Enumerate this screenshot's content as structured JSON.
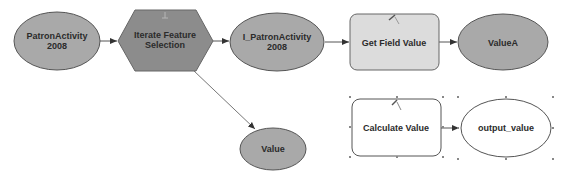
{
  "diagram": {
    "type": "model-builder-flowchart",
    "colors": {
      "background": "#ffffff",
      "data_fill": "#a9a9a9",
      "tool_fill_dark": "#8c8c8c",
      "tool_fill_light": "#dcdcdc",
      "output_fill": "#ffffff",
      "stroke": "#555555",
      "connector": "#555555",
      "handle": "#888888"
    },
    "nodes": [
      {
        "id": "patron_activity_2008",
        "shape": "ellipse",
        "label_line1": "PatronActivity",
        "label_line2": "2008"
      },
      {
        "id": "iterate_feature_selection",
        "shape": "hexagon",
        "label_line1": "Iterate Feature",
        "label_line2": "Selection"
      },
      {
        "id": "i_patron_activity_2008",
        "shape": "ellipse",
        "label_line1": "I_PatronActivity",
        "label_line2": "2008"
      },
      {
        "id": "get_field_value",
        "shape": "rounded-rect",
        "label_line1": "Get Field Value"
      },
      {
        "id": "value_a",
        "shape": "ellipse",
        "label_line1": "ValueA"
      },
      {
        "id": "value",
        "shape": "ellipse",
        "label_line1": "Value"
      },
      {
        "id": "calculate_value",
        "shape": "rounded-rect",
        "label_line1": "Calculate Value",
        "selected": true
      },
      {
        "id": "output_value",
        "shape": "ellipse",
        "label_line1": "output_value",
        "selected": true
      }
    ],
    "edges": [
      {
        "from": "patron_activity_2008",
        "to": "iterate_feature_selection"
      },
      {
        "from": "iterate_feature_selection",
        "to": "i_patron_activity_2008"
      },
      {
        "from": "iterate_feature_selection",
        "to": "value"
      },
      {
        "from": "i_patron_activity_2008",
        "to": "get_field_value"
      },
      {
        "from": "get_field_value",
        "to": "value_a"
      },
      {
        "from": "calculate_value",
        "to": "output_value"
      }
    ]
  }
}
